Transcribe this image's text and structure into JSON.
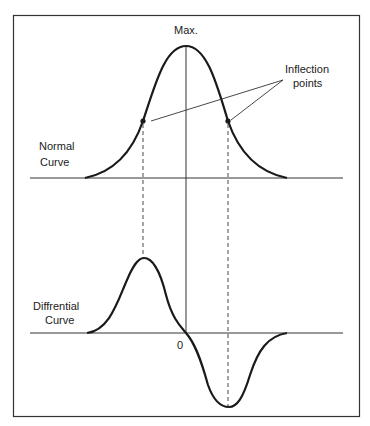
{
  "diagram": {
    "labels": {
      "max": "Max.",
      "inflection_line1": "Inflection",
      "inflection_line2": "points",
      "normal_line1": "Normal",
      "normal_line2": "Curve",
      "diff_line1": "Diffrential",
      "diff_line2": "Curve",
      "zero": "0"
    },
    "colors": {
      "stroke": "#1a1a1a",
      "frame": "#333333",
      "background": "#ffffff"
    }
  }
}
